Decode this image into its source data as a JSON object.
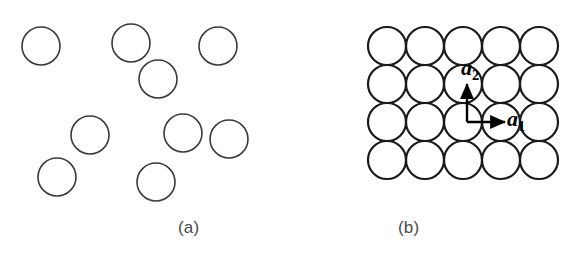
{
  "figure": {
    "background_color": "#ffffff",
    "width": 588,
    "height": 262,
    "panels": [
      {
        "id": "a",
        "caption": "(a)",
        "kind": "amorphous-disordered-circles",
        "circle_stroke_color": "#3a3a3a",
        "circle_stroke_width": 1.6,
        "circle_fill": "none",
        "circle_radius": 19,
        "circles": [
          {
            "cx": 41,
            "cy": 46,
            "r": 19
          },
          {
            "cx": 131,
            "cy": 43,
            "r": 19
          },
          {
            "cx": 218,
            "cy": 46,
            "r": 19
          },
          {
            "cx": 158,
            "cy": 79,
            "r": 19
          },
          {
            "cx": 90,
            "cy": 135,
            "r": 19
          },
          {
            "cx": 183,
            "cy": 133,
            "r": 19
          },
          {
            "cx": 229,
            "cy": 139,
            "r": 19
          },
          {
            "cx": 57,
            "cy": 177,
            "r": 19
          },
          {
            "cx": 156,
            "cy": 182,
            "r": 19
          }
        ]
      },
      {
        "id": "b",
        "caption": "(b)",
        "kind": "crystalline-square-lattice",
        "circle_stroke_color": "#1a1a1a",
        "circle_stroke_width": 2.2,
        "circle_fill": "none",
        "circle_radius": 19,
        "rows": 4,
        "columns": 5,
        "lattice_origin_x": 387,
        "lattice_origin_y": 46,
        "lattice_spacing": 38,
        "vectors": [
          {
            "name": "a1",
            "label_base": "a",
            "label_subscript": "1",
            "direction": "horizontal-right",
            "origin_x": 467,
            "origin_y": 122,
            "tip_x": 505,
            "tip_y": 122,
            "color": "#000000",
            "stroke_width": 2.4
          },
          {
            "name": "a2",
            "label_base": "a",
            "label_subscript": "2",
            "direction": "vertical-up",
            "origin_x": 467,
            "origin_y": 122,
            "tip_x": 467,
            "tip_y": 84,
            "color": "#000000",
            "stroke_width": 2.4
          }
        ]
      }
    ]
  }
}
